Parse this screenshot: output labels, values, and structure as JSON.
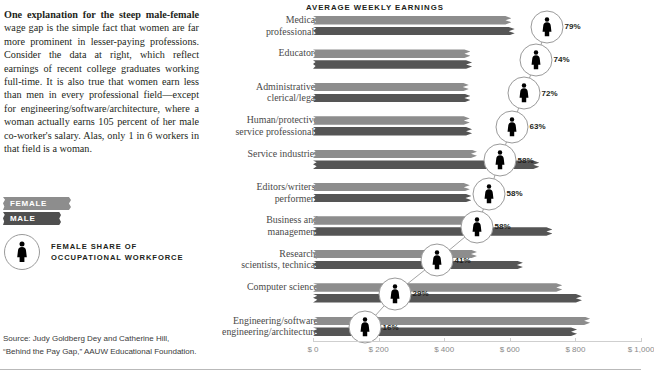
{
  "article": {
    "lede_bold": "One explanation for the steep male-female",
    "lede_rest": " wage gap is the simple fact that women are far more prominent in lesser-paying professions. Consider the data at right, which reflect earnings of recent college graduates working full-time. It is also true that women earn less than men in every professional field—except for engineering/software/architecture, where a woman actually earns 105 percent of her male co-worker's salary. Alas, only 1 in 6 workers in that field is a woman."
  },
  "legend": {
    "female_label": "FEMALE",
    "male_label": "MALE",
    "female_color": "#8d8d8d",
    "male_color": "#555555",
    "share_line1": "FEMALE SHARE OF",
    "share_line2": "OCCUPATIONAL WORKFORCE",
    "share_icon": "female-figure-icon"
  },
  "source": {
    "line1": "Source: Judy Goldberg Dey and Catherine Hill,",
    "line2": "“Behind the Pay Gap,” AAUW Educational Foundation."
  },
  "chart_data": {
    "type": "bar",
    "title": "AVERAGE WEEKLY EARNINGS",
    "xlabel": "",
    "ylabel": "",
    "grid": false,
    "orientation": "horizontal",
    "xlim": [
      0,
      1000
    ],
    "ticks": [
      0,
      200,
      400,
      600,
      800,
      1000
    ],
    "tick_labels": [
      "$ 0",
      "$ 200",
      "$ 400",
      "$ 600",
      "$ 800",
      "$ 1,000"
    ],
    "legend_position": "left-panel",
    "categories": [
      "Medical\nprofessionals",
      "Educators",
      "Administrative/\nclerical/legal",
      "Human/protective\nservice professionals",
      "Service industries",
      "Editors/writers/\nperformers",
      "Business and\nmanagement",
      "Research,\nscientists, technical",
      "Computer science",
      "Engineering/software\nengineering/architecture"
    ],
    "series": [
      {
        "name": "FEMALE",
        "color": "#8d8d8d",
        "values": [
          605,
          480,
          475,
          478,
          500,
          478,
          483,
          500,
          760,
          845
        ]
      },
      {
        "name": "MALE",
        "color": "#555555",
        "values": [
          615,
          485,
          480,
          485,
          690,
          483,
          730,
          640,
          820,
          805
        ]
      }
    ],
    "annotations": {
      "name": "female-share-of-workforce",
      "unit": "percent",
      "values": [
        79,
        74,
        72,
        63,
        58,
        58,
        58,
        41,
        29,
        16
      ],
      "labels": [
        "79%",
        "74%",
        "72%",
        "63%",
        "58%",
        "58%",
        "58%",
        "41%",
        "29%",
        "16%"
      ],
      "icon": "female-figure-icon"
    }
  }
}
